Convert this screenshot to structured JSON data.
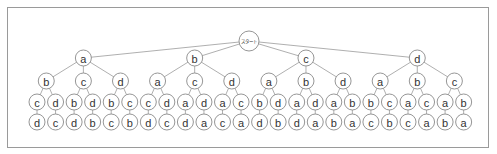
{
  "diagram": {
    "type": "tree",
    "root": {
      "label": "スタート",
      "children": [
        {
          "label": "a",
          "children": [
            {
              "label": "b",
              "children": [
                {
                  "label": "c",
                  "children": [
                    {
                      "label": "d"
                    }
                  ]
                },
                {
                  "label": "d",
                  "children": [
                    {
                      "label": "c"
                    }
                  ]
                }
              ]
            },
            {
              "label": "c",
              "children": [
                {
                  "label": "b",
                  "children": [
                    {
                      "label": "d"
                    }
                  ]
                },
                {
                  "label": "d",
                  "children": [
                    {
                      "label": "b"
                    }
                  ]
                }
              ]
            },
            {
              "label": "d",
              "children": [
                {
                  "label": "b",
                  "children": [
                    {
                      "label": "c"
                    }
                  ]
                },
                {
                  "label": "c",
                  "children": [
                    {
                      "label": "b"
                    }
                  ]
                }
              ]
            }
          ]
        },
        {
          "label": "b",
          "children": [
            {
              "label": "a",
              "children": [
                {
                  "label": "c",
                  "children": [
                    {
                      "label": "d"
                    }
                  ]
                },
                {
                  "label": "d",
                  "children": [
                    {
                      "label": "c"
                    }
                  ]
                }
              ]
            },
            {
              "label": "c",
              "children": [
                {
                  "label": "a",
                  "children": [
                    {
                      "label": "d"
                    }
                  ]
                },
                {
                  "label": "d",
                  "children": [
                    {
                      "label": "a"
                    }
                  ]
                }
              ]
            },
            {
              "label": "d",
              "children": [
                {
                  "label": "a",
                  "children": [
                    {
                      "label": "c"
                    }
                  ]
                },
                {
                  "label": "c",
                  "children": [
                    {
                      "label": "a"
                    }
                  ]
                }
              ]
            }
          ]
        },
        {
          "label": "c",
          "children": [
            {
              "label": "a",
              "children": [
                {
                  "label": "b",
                  "children": [
                    {
                      "label": "d"
                    }
                  ]
                },
                {
                  "label": "d",
                  "children": [
                    {
                      "label": "b"
                    }
                  ]
                }
              ]
            },
            {
              "label": "b",
              "children": [
                {
                  "label": "a",
                  "children": [
                    {
                      "label": "d"
                    }
                  ]
                },
                {
                  "label": "d",
                  "children": [
                    {
                      "label": "a"
                    }
                  ]
                }
              ]
            },
            {
              "label": "d",
              "children": [
                {
                  "label": "a",
                  "children": [
                    {
                      "label": "b"
                    }
                  ]
                },
                {
                  "label": "b",
                  "children": [
                    {
                      "label": "a"
                    }
                  ]
                }
              ]
            }
          ]
        },
        {
          "label": "d",
          "children": [
            {
              "label": "a",
              "children": [
                {
                  "label": "b",
                  "children": [
                    {
                      "label": "c"
                    }
                  ]
                },
                {
                  "label": "c",
                  "children": [
                    {
                      "label": "b"
                    }
                  ]
                }
              ]
            },
            {
              "label": "b",
              "children": [
                {
                  "label": "a",
                  "children": [
                    {
                      "label": "c"
                    }
                  ]
                },
                {
                  "label": "c",
                  "children": [
                    {
                      "label": "a"
                    }
                  ]
                }
              ]
            },
            {
              "label": "c",
              "children": [
                {
                  "label": "a",
                  "children": [
                    {
                      "label": "b"
                    }
                  ]
                },
                {
                  "label": "b",
                  "children": [
                    {
                      "label": "a"
                    }
                  ]
                }
              ]
            }
          ]
        }
      ]
    },
    "colors": {
      "edge": "#9a9a9a",
      "node_stroke": "#8a8a8a",
      "node_fill": "#ffffff",
      "text": "#333333",
      "frame": "#9a9a9a"
    }
  }
}
